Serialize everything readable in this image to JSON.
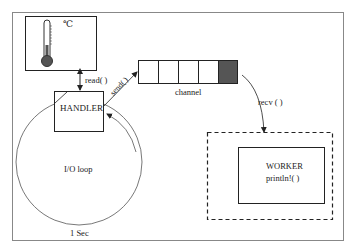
{
  "diagram": {
    "sensor": {
      "unit_label": "℃",
      "icon": "thermometer-icon"
    },
    "handler": {
      "label": "HANDLER"
    },
    "io_loop": {
      "label": "I/O loop",
      "period_label": "1 Sec"
    },
    "channel": {
      "label": "channel",
      "cells": 5,
      "filled_cell_index": 4,
      "filled_color": "#555555"
    },
    "worker": {
      "title": "WORKER",
      "call": "println!( )"
    },
    "edges": {
      "read": "read( )",
      "send": "send( )",
      "recv": "recv ( )"
    },
    "colors": {
      "stroke": "#333333",
      "thermo_fill": "#555555",
      "frame": "#777777"
    }
  }
}
